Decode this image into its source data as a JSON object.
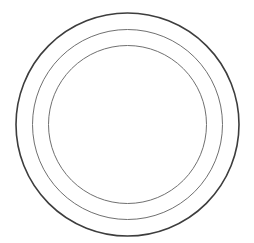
{
  "diagram": {
    "type": "concentric-circles",
    "background": "#ffffff",
    "center": {
      "cx": 127.5,
      "cy": 124.5
    },
    "rings": [
      {
        "name": "outer-ring",
        "r": 111.5,
        "stroke": "#3d3d3d",
        "stroke_width": 1.6
      },
      {
        "name": "middle-ring",
        "r": 95,
        "stroke": "#707070",
        "stroke_width": 1.0
      },
      {
        "name": "inner-ring",
        "r": 79,
        "stroke": "#707070",
        "stroke_width": 1.0
      }
    ]
  }
}
